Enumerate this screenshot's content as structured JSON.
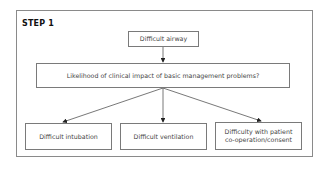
{
  "step_label": "STEP 1",
  "nodes": {
    "root": "Difficult airway",
    "question": "Likelihood of clinical impact of basic management problems?",
    "outcomes": [
      {
        "label": "Difficult intubation"
      },
      {
        "label": "Difficult ventilation"
      },
      {
        "label_line1": "Difficulty with patient",
        "label_line2": "co-operation/consent"
      }
    ]
  }
}
